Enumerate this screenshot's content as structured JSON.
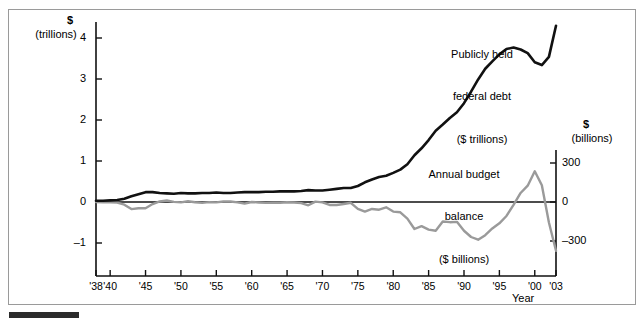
{
  "figure": {
    "bottom_rule": "section-rule"
  },
  "chart_data": {
    "type": "line",
    "title": "",
    "xlabel": "Year",
    "ylabel": "$ (trillions)",
    "y2label": "$ (billions)",
    "x": [
      1938,
      1939,
      1940,
      1941,
      1942,
      1943,
      1944,
      1945,
      1946,
      1947,
      1948,
      1949,
      1950,
      1951,
      1952,
      1953,
      1954,
      1955,
      1956,
      1957,
      1958,
      1959,
      1960,
      1961,
      1962,
      1963,
      1964,
      1965,
      1966,
      1967,
      1968,
      1969,
      1970,
      1971,
      1972,
      1973,
      1974,
      1975,
      1976,
      1977,
      1978,
      1979,
      1980,
      1981,
      1982,
      1983,
      1984,
      1985,
      1986,
      1987,
      1988,
      1989,
      1990,
      1991,
      1992,
      1993,
      1994,
      1995,
      1996,
      1997,
      1998,
      1999,
      2000,
      2001,
      2002,
      2003
    ],
    "xlim": [
      1938,
      2003
    ],
    "ylim_left": [
      -1.45,
      4.55
    ],
    "ylim_right": [
      -435,
      1365
    ],
    "left_ticks": [
      4,
      3,
      2,
      1,
      0,
      -1
    ],
    "left_tick_labels": [
      "4",
      "3",
      "2",
      "1",
      "0",
      "–1"
    ],
    "right_ticks": [
      300,
      0,
      -300
    ],
    "right_tick_labels": [
      "300",
      "0",
      "–300"
    ],
    "x_tick_values": [
      1938,
      1940,
      1945,
      1950,
      1955,
      1960,
      1965,
      1970,
      1975,
      1980,
      1985,
      1990,
      1995,
      2000,
      2003
    ],
    "x_tick_labels": [
      "'38",
      "'40",
      "'45",
      "'50",
      "'55",
      "'60",
      "'65",
      "'70",
      "'75",
      "'80",
      "'85",
      "'90",
      "'95",
      "'00",
      "'03"
    ],
    "grid": false,
    "legend": "none",
    "series": [
      {
        "name": "Publicly held federal debt ($ trillions)",
        "axis": "left",
        "color": "#111111",
        "width": 2.6,
        "units": "trillions of dollars",
        "values": [
          0.03,
          0.03,
          0.04,
          0.05,
          0.08,
          0.14,
          0.19,
          0.24,
          0.24,
          0.22,
          0.21,
          0.2,
          0.22,
          0.21,
          0.21,
          0.22,
          0.22,
          0.23,
          0.22,
          0.22,
          0.23,
          0.24,
          0.24,
          0.24,
          0.25,
          0.25,
          0.26,
          0.26,
          0.26,
          0.27,
          0.29,
          0.28,
          0.28,
          0.3,
          0.32,
          0.34,
          0.34,
          0.39,
          0.48,
          0.55,
          0.61,
          0.64,
          0.71,
          0.79,
          0.92,
          1.14,
          1.31,
          1.51,
          1.74,
          1.89,
          2.05,
          2.19,
          2.41,
          2.69,
          2.99,
          3.25,
          3.43,
          3.6,
          3.73,
          3.77,
          3.72,
          3.63,
          3.41,
          3.34,
          3.54,
          4.3
        ]
      },
      {
        "name": "Annual budget balance ($ billions)",
        "axis": "right",
        "color": "#9a9a9a",
        "width": 2.4,
        "units": "billions of dollars",
        "values": [
          -0.1,
          -2.8,
          -2.9,
          -4.9,
          -20.5,
          -54.6,
          -47.6,
          -47.6,
          -15.9,
          4.0,
          11.8,
          0.6,
          -3.1,
          6.1,
          -1.5,
          -6.5,
          -1.2,
          -3.0,
          3.9,
          3.4,
          -2.8,
          -12.8,
          0.3,
          -3.3,
          -7.1,
          -4.8,
          -5.9,
          -1.4,
          -3.7,
          -8.6,
          -25.2,
          3.2,
          -2.8,
          -23.0,
          -23.4,
          -14.9,
          -6.1,
          -53.2,
          -73.7,
          -53.7,
          -59.2,
          -40.7,
          -73.8,
          -79.0,
          -128.0,
          -207.8,
          -185.4,
          -212.3,
          -221.2,
          -149.7,
          -155.2,
          -152.6,
          -221.0,
          -269.2,
          -290.3,
          -255.1,
          -203.2,
          -164.0,
          -107.4,
          -21.9,
          69.3,
          125.6,
          236.2,
          128.2,
          -157.8,
          -375.0
        ]
      }
    ],
    "annotations": [
      {
        "id": "debt-annotation",
        "lines": [
          "Publicly held",
          "federal debt",
          "($ trillions)"
        ],
        "x": 482,
        "y": 18
      },
      {
        "id": "balance-annotation",
        "lines": [
          "Annual budget",
          "balance",
          "($ billions)"
        ],
        "x": 462,
        "y": 138
      }
    ]
  },
  "axes": {
    "left": {
      "unit_line1": "$",
      "unit_line2": "(trillions)"
    },
    "right": {
      "unit_line1": "$",
      "unit_line2": "(billions)"
    },
    "x": {
      "title": "Year"
    }
  }
}
